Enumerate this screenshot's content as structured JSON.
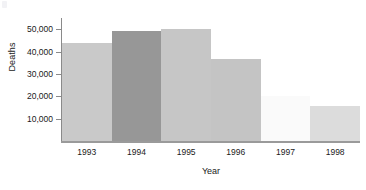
{
  "chart_data": {
    "type": "bar",
    "title": "",
    "xlabel": "Year",
    "ylabel": "Deaths",
    "categories": [
      "1993",
      "1994",
      "1995",
      "1996",
      "1997",
      "1998"
    ],
    "values": [
      44000,
      49000,
      50000,
      36500,
      20000,
      15500
    ],
    "ylim": [
      0,
      55000
    ],
    "ytick_values": [
      10000,
      20000,
      30000,
      40000,
      50000
    ],
    "ytick_labels": [
      "10,000",
      "20,000",
      "30,000",
      "40,000",
      "50,000"
    ],
    "grid": false,
    "legend": "none",
    "bar_colors": [
      "#c9c9c9",
      "#979797",
      "#c6c6c6",
      "#c4c4c4",
      "#fafafa",
      "#dcdcdc"
    ],
    "axis_color": "#8a8a8a",
    "text_color": "#1a1a1a",
    "background": "#ffffff"
  }
}
